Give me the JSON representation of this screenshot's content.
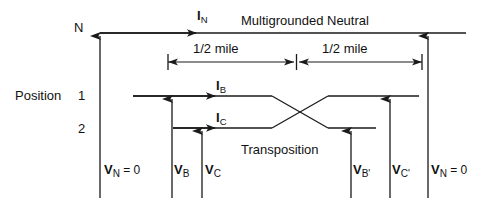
{
  "diagram": {
    "title_text": "Multigrounded Neutral",
    "transposition_text": "Transposition",
    "position_label": "Position",
    "node_label_n": "N",
    "position_rows": [
      "1",
      "2"
    ],
    "dimensions": {
      "left_span_label": "1/2  mile",
      "right_span_label": "1/2  mile"
    },
    "currents": [
      {
        "name": "I_N",
        "main": "I",
        "sub": "N"
      },
      {
        "name": "I_B",
        "main": "I",
        "sub": "B"
      },
      {
        "name": "I_C",
        "main": "I",
        "sub": "C"
      }
    ],
    "voltages": [
      {
        "name": "V_N_left",
        "main": "V",
        "sub": "N",
        "suffix": " = 0"
      },
      {
        "name": "V_B",
        "main": "V",
        "sub": "B",
        "suffix": ""
      },
      {
        "name": "V_C",
        "main": "V",
        "sub": "C",
        "suffix": ""
      },
      {
        "name": "V_B_prime",
        "main": "V",
        "sub": "B'",
        "suffix": ""
      },
      {
        "name": "V_C_prime",
        "main": "V",
        "sub": "C'",
        "suffix": ""
      },
      {
        "name": "V_N_right",
        "main": "V",
        "sub": "N",
        "suffix": " = 0"
      }
    ],
    "colors": {
      "line": "#1a1a1a",
      "text": "#111111",
      "background": "#ffffff"
    }
  }
}
